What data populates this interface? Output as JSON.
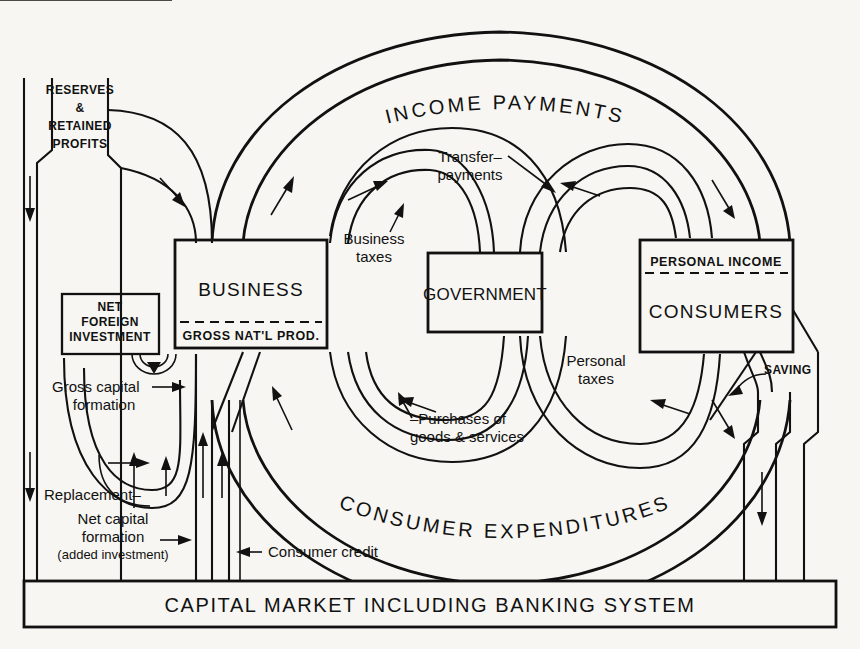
{
  "diagram": {
    "background": "#f7f6f2",
    "ink": "#111111"
  },
  "boxes": {
    "business": {
      "label": "BUSINESS",
      "sub_label": "GROSS NAT'L PROD."
    },
    "government": {
      "label": "GOVERNMENT"
    },
    "consumers": {
      "label": "CONSUMERS",
      "top_label": "PERSONAL INCOME"
    },
    "net_foreign_investment": {
      "line1": "NET",
      "line2": "FOREIGN",
      "line3": "INVESTMENT"
    },
    "reserves": {
      "line1": "RESERVES",
      "line2": "&",
      "line3": "RETAINED",
      "line4": "PROFITS"
    },
    "capital_market": {
      "label": "CAPITAL MARKET INCLUDING BANKING SYSTEM"
    }
  },
  "arc_labels": {
    "income_payments": "INCOME PAYMENTS",
    "consumer_expenditures": "CONSUMER EXPENDITURES"
  },
  "flow_labels": {
    "transfer_payments_l1": "Transfer–",
    "transfer_payments_l2": "payments",
    "business_taxes_l1": "Business",
    "business_taxes_l2": "taxes",
    "personal_taxes_l1": "Personal",
    "personal_taxes_l2": "taxes",
    "purchases_l1": "–Purchases of",
    "purchases_l2": "goods & services",
    "gross_capital_formation_l1": "Gross capital",
    "gross_capital_formation_l2": "formation",
    "replacement": "Replacement–",
    "net_capital_formation_l1": "Net capital",
    "net_capital_formation_l2": "formation",
    "net_capital_formation_l3": "(added investment)",
    "consumer_credit": "Consumer credit",
    "saving": "SAVING"
  }
}
